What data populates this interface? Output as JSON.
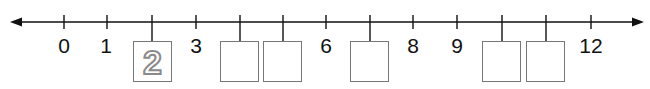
{
  "number_line": {
    "min": 0,
    "max": 12,
    "axis_y": 22,
    "start_x": 64,
    "tick_spacing": 43.9,
    "line_color": "#111111",
    "box_border_color": "#777777",
    "arrows": [
      "left",
      "right"
    ],
    "ticks": [
      {
        "value": 0,
        "label": "0",
        "shown": true
      },
      {
        "value": 1,
        "label": "1",
        "shown": true
      },
      {
        "value": 2,
        "label": "",
        "shown": false,
        "box": true,
        "hint": "2"
      },
      {
        "value": 3,
        "label": "3",
        "shown": true
      },
      {
        "value": 4,
        "label": "",
        "shown": false,
        "box": true,
        "hint": ""
      },
      {
        "value": 5,
        "label": "",
        "shown": false,
        "box": true,
        "hint": ""
      },
      {
        "value": 6,
        "label": "6",
        "shown": true
      },
      {
        "value": 7,
        "label": "",
        "shown": false,
        "box": true,
        "hint": ""
      },
      {
        "value": 8,
        "label": "8",
        "shown": true
      },
      {
        "value": 9,
        "label": "9",
        "shown": true
      },
      {
        "value": 10,
        "label": "",
        "shown": false,
        "box": true,
        "hint": ""
      },
      {
        "value": 11,
        "label": "",
        "shown": false,
        "box": true,
        "hint": ""
      },
      {
        "value": 12,
        "label": "12",
        "shown": true
      }
    ]
  },
  "labels": {
    "t0": "0",
    "t1": "1",
    "t3": "3",
    "t6": "6",
    "t8": "8",
    "t9": "9",
    "t12": "12",
    "hint2": "2"
  }
}
